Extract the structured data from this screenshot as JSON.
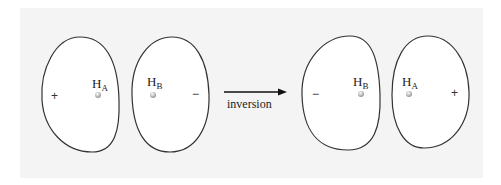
{
  "diagram": {
    "operation_label": "inversion",
    "before": {
      "left_lobe": {
        "sign": "+",
        "atom": "H",
        "atom_subscript": "A"
      },
      "right_lobe": {
        "sign": "−",
        "atom": "H",
        "atom_subscript": "B"
      }
    },
    "after": {
      "left_lobe": {
        "sign": "−",
        "atom": "H",
        "atom_subscript": "B"
      },
      "right_lobe": {
        "sign": "+",
        "atom": "H",
        "atom_subscript": "A"
      }
    },
    "colors": {
      "background": "#f4f4f4",
      "outline": "#333333",
      "atom": "#bbbbbb"
    }
  }
}
